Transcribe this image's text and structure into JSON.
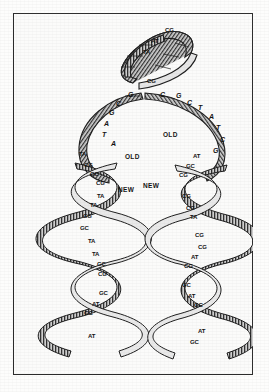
{
  "figure": {
    "colors": {
      "frame": "#2a2a2a",
      "background": "#fbfbfa",
      "ink": "#111111",
      "ribbon_fill": "#c9c9c9",
      "ribbon_shadow": "#4a4a4a"
    }
  },
  "parent_helix": {
    "name": "parent-duplex",
    "base_pairs": [
      {
        "id": "p1",
        "label": "CG",
        "x": 152,
        "y": 30
      },
      {
        "id": "p2",
        "label": "AT",
        "x": 138,
        "y": 41
      },
      {
        "id": "p3",
        "label": "TA",
        "x": 130,
        "y": 52
      },
      {
        "id": "p4",
        "label": "CG",
        "x": 134,
        "y": 81
      }
    ]
  },
  "replication_fork": {
    "name": "unpaired-bases",
    "left_strand_bases": [
      {
        "id": "l1",
        "label": "G",
        "x": 115,
        "y": 95
      },
      {
        "id": "l2",
        "label": "C",
        "x": 103,
        "y": 104
      },
      {
        "id": "l3",
        "label": "G",
        "x": 96,
        "y": 113
      },
      {
        "id": "l4",
        "label": "A",
        "x": 91,
        "y": 124
      },
      {
        "id": "l5",
        "label": "T",
        "x": 89,
        "y": 135
      },
      {
        "id": "l6",
        "label": "A",
        "x": 98,
        "y": 144
      }
    ],
    "right_strand_bases": [
      {
        "id": "r1",
        "label": "C",
        "x": 147,
        "y": 95
      },
      {
        "id": "r2",
        "label": "G",
        "x": 163,
        "y": 96
      },
      {
        "id": "r3",
        "label": "C",
        "x": 174,
        "y": 103
      },
      {
        "id": "r4",
        "label": "T",
        "x": 185,
        "y": 108
      },
      {
        "id": "r5",
        "label": "A",
        "x": 196,
        "y": 117
      },
      {
        "id": "r6",
        "label": "T",
        "x": 203,
        "y": 128
      },
      {
        "id": "r7",
        "label": "C",
        "x": 207,
        "y": 140
      },
      {
        "id": "r8",
        "label": "G",
        "x": 200,
        "y": 151
      }
    ]
  },
  "left_daughter_helix": {
    "name": "left-daughter-duplex",
    "strand_labels": [
      {
        "id": "lold",
        "label": "OLD",
        "x": 125,
        "y": 157
      },
      {
        "id": "lnew",
        "label": "NEW",
        "x": 118,
        "y": 190
      }
    ],
    "base_pairs": [
      {
        "id": "la",
        "label": "TA",
        "x": 79,
        "y": 154
      },
      {
        "id": "lb",
        "label": "CG",
        "x": 84,
        "y": 165
      },
      {
        "id": "lc",
        "label": "GC",
        "x": 90,
        "y": 174
      },
      {
        "id": "ld",
        "label": "CG",
        "x": 96,
        "y": 183
      },
      {
        "id": "le",
        "label": "TA",
        "x": 97,
        "y": 196
      },
      {
        "id": "lf",
        "label": "TA",
        "x": 90,
        "y": 205
      },
      {
        "id": "lg",
        "label": "CG",
        "x": 83,
        "y": 216
      },
      {
        "id": "lh",
        "label": "GC",
        "x": 80,
        "y": 228
      },
      {
        "id": "li",
        "label": "TA",
        "x": 88,
        "y": 241
      },
      {
        "id": "lj",
        "label": "TA",
        "x": 92,
        "y": 254
      },
      {
        "id": "lk",
        "label": "GC",
        "x": 97,
        "y": 264
      },
      {
        "id": "ll",
        "label": "CG",
        "x": 98,
        "y": 274
      },
      {
        "id": "lm",
        "label": "GC",
        "x": 99,
        "y": 293
      },
      {
        "id": "ln",
        "label": "AT",
        "x": 92,
        "y": 304
      },
      {
        "id": "lo",
        "label": "GC",
        "x": 84,
        "y": 313
      },
      {
        "id": "lp",
        "label": "AT",
        "x": 88,
        "y": 336
      }
    ]
  },
  "right_daughter_helix": {
    "name": "right-daughter-duplex",
    "strand_labels": [
      {
        "id": "rold",
        "label": "OLD",
        "x": 163,
        "y": 135
      },
      {
        "id": "rnew",
        "label": "NEW",
        "x": 143,
        "y": 186
      }
    ],
    "base_pairs": [
      {
        "id": "ra",
        "label": "AT",
        "x": 193,
        "y": 156
      },
      {
        "id": "rb",
        "label": "GC",
        "x": 186,
        "y": 166
      },
      {
        "id": "rc",
        "label": "CG",
        "x": 179,
        "y": 175
      },
      {
        "id": "rd",
        "label": "CG",
        "x": 182,
        "y": 196
      },
      {
        "id": "re",
        "label": "CG",
        "x": 186,
        "y": 208
      },
      {
        "id": "rf",
        "label": "TA",
        "x": 190,
        "y": 217
      },
      {
        "id": "rg",
        "label": "CG",
        "x": 195,
        "y": 235
      },
      {
        "id": "rh",
        "label": "CG",
        "x": 198,
        "y": 247
      },
      {
        "id": "ri",
        "label": "AT",
        "x": 191,
        "y": 257
      },
      {
        "id": "rj",
        "label": "CG",
        "x": 184,
        "y": 266
      },
      {
        "id": "rk",
        "label": "GC",
        "x": 182,
        "y": 285
      },
      {
        "id": "rl",
        "label": "AT",
        "x": 188,
        "y": 296
      },
      {
        "id": "rm",
        "label": "GC",
        "x": 194,
        "y": 305
      },
      {
        "id": "rn",
        "label": "AT",
        "x": 198,
        "y": 331
      },
      {
        "id": "ro",
        "label": "GC",
        "x": 190,
        "y": 342
      }
    ]
  }
}
